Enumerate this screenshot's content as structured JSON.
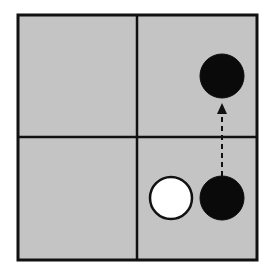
{
  "diagram": {
    "title": "",
    "background": "#ffffff",
    "board": {
      "x": 18,
      "y": 15,
      "width": 239,
      "height": 245,
      "fill": "#c4c4c4",
      "border_color": "#111111",
      "border_width": 3,
      "rows": 2,
      "cols": 2,
      "divider_x": 137,
      "divider_y": 137,
      "divider_width": 2.5
    },
    "cells": [
      {
        "row": 0,
        "col": 0,
        "label": "top-left"
      },
      {
        "row": 0,
        "col": 1,
        "label": "top-right"
      },
      {
        "row": 1,
        "col": 0,
        "label": "bottom-left"
      },
      {
        "row": 1,
        "col": 1,
        "label": "bottom-right"
      }
    ],
    "pieces": [
      {
        "name": "black-stone-top-right",
        "color": "black",
        "cx": 222,
        "cy": 76,
        "r": 22,
        "fill": "#0a0a0a",
        "stroke": "#0a0a0a"
      },
      {
        "name": "white-stone-bottom-right",
        "color": "white",
        "cx": 171,
        "cy": 198,
        "r": 21,
        "fill": "#ffffff",
        "stroke": "#111111"
      },
      {
        "name": "black-stone-bottom-right",
        "color": "black",
        "cx": 222,
        "cy": 198,
        "r": 22,
        "fill": "#0a0a0a",
        "stroke": "#0a0a0a"
      }
    ],
    "arrows": [
      {
        "name": "move-arrow",
        "style": "dashed",
        "from": {
          "x": 222,
          "y": 176
        },
        "to": {
          "x": 222,
          "y": 103
        },
        "color": "#111111"
      }
    ]
  }
}
